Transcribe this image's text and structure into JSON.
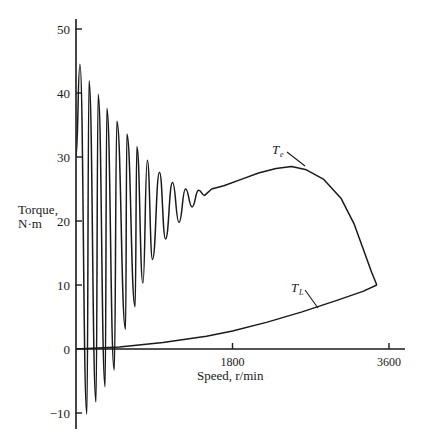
{
  "chart_data": {
    "type": "line",
    "title": "",
    "xlabel": "Speed, r/min",
    "ylabel": "Torque, N·m",
    "ylabel_lines": [
      "Torque,",
      "N·m"
    ],
    "xlim": [
      0,
      3800
    ],
    "ylim": [
      -12.5,
      52
    ],
    "grid": false,
    "legend": "none (inline curve labels)",
    "x_ticks": [
      {
        "value": 1800,
        "label": "1800"
      },
      {
        "value": 3600,
        "label": "3600"
      }
    ],
    "y_ticks": [
      {
        "value": 50,
        "label": "50"
      },
      {
        "value": 40,
        "label": "40"
      },
      {
        "value": 30,
        "label": "30"
      },
      {
        "value": 20,
        "label": "20"
      },
      {
        "value": 10,
        "label": "10"
      },
      {
        "value": 0,
        "label": "0"
      },
      {
        "value": -10,
        "label": "−10"
      }
    ],
    "series": [
      {
        "name": "Te",
        "label_main": "T",
        "label_sub": "e",
        "description": "Electromagnetic torque during start-up, with decaying oscillations",
        "points": [
          [
            0,
            -12.3
          ],
          [
            0,
            30
          ],
          [
            30,
            38
          ],
          [
            45,
            44.5
          ],
          [
            75,
            30
          ],
          [
            110,
            0
          ],
          [
            125,
            -10.2
          ],
          [
            135,
            10
          ],
          [
            160,
            38
          ],
          [
            150,
            41.9
          ],
          [
            180,
            30
          ],
          [
            210,
            0
          ],
          [
            230,
            -8.3
          ],
          [
            245,
            10
          ],
          [
            255,
            39.8
          ],
          [
            290,
            30
          ],
          [
            320,
            0
          ],
          [
            335,
            -5.9
          ],
          [
            350,
            10
          ],
          [
            355,
            37.6
          ],
          [
            390,
            25
          ],
          [
            430,
            0
          ],
          [
            440,
            -3.3
          ],
          [
            455,
            10
          ],
          [
            470,
            35.6
          ],
          [
            510,
            20
          ],
          [
            550,
            0
          ],
          [
            570,
            3.1
          ],
          [
            590,
            15
          ],
          [
            585,
            33.6
          ],
          [
            630,
            20
          ],
          [
            660,
            5
          ],
          [
            680,
            6.6
          ],
          [
            700,
            18
          ],
          [
            700,
            31.6
          ],
          [
            740,
            18
          ],
          [
            770,
            10.3
          ],
          [
            820,
            29.5
          ],
          [
            860,
            20
          ],
          [
            880,
            14.0
          ],
          [
            960,
            27.6
          ],
          [
            1000,
            22
          ],
          [
            1030,
            17.2
          ],
          [
            1110,
            26.0
          ],
          [
            1150,
            21
          ],
          [
            1185,
            19.8
          ],
          [
            1260,
            25.0
          ],
          [
            1300,
            22.8
          ],
          [
            1335,
            22.2
          ],
          [
            1410,
            24.8
          ],
          [
            1450,
            24.2
          ],
          [
            1480,
            24.0
          ],
          [
            1560,
            25.0
          ],
          [
            1700,
            25.5
          ],
          [
            1900,
            26.5
          ],
          [
            2100,
            27.5
          ],
          [
            2300,
            28.2
          ],
          [
            2480,
            28.5
          ],
          [
            2650,
            28.0
          ],
          [
            2850,
            26.5
          ],
          [
            3050,
            23.5
          ],
          [
            3200,
            19.5
          ],
          [
            3320,
            15.0
          ],
          [
            3400,
            12.0
          ],
          [
            3460,
            10.0
          ]
        ]
      },
      {
        "name": "TL",
        "label_main": "T",
        "label_sub": "L",
        "description": "Load torque (approximately quadratic in speed)",
        "points": [
          [
            0,
            0
          ],
          [
            500,
            0.3
          ],
          [
            1000,
            1.0
          ],
          [
            1500,
            2.0
          ],
          [
            1800,
            2.8
          ],
          [
            2200,
            4.2
          ],
          [
            2600,
            5.8
          ],
          [
            3000,
            7.6
          ],
          [
            3300,
            9.0
          ],
          [
            3460,
            10.0
          ]
        ]
      }
    ],
    "annotations": [
      {
        "text": "Te",
        "near": [
          2150,
          31.5
        ],
        "points_to": [
          2450,
          28.5
        ]
      },
      {
        "text": "TL",
        "near": [
          2400,
          13.5
        ],
        "points_to": [
          2620,
          5.9
        ]
      }
    ]
  }
}
